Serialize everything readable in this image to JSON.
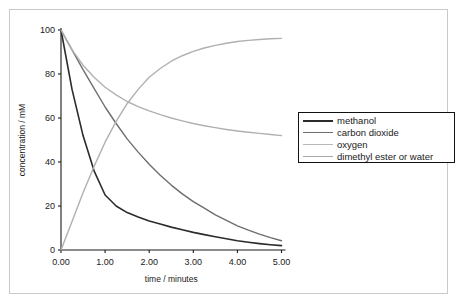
{
  "figure": {
    "background": "#ffffff",
    "frame_color": "#c9c9c9",
    "axis_color": "#1a1a1a"
  },
  "chart_data": {
    "type": "line",
    "title": "",
    "xlabel": "time / minutes",
    "ylabel": "concentration / mM",
    "xlim": [
      0,
      5
    ],
    "ylim": [
      0,
      100
    ],
    "xticks": [
      0,
      1,
      2,
      3,
      4,
      5
    ],
    "xtick_labels": [
      "0.00",
      "1.00",
      "2.00",
      "3.00",
      "4.00",
      "5.00"
    ],
    "yticks": [
      0,
      20,
      40,
      60,
      80,
      100
    ],
    "ytick_labels": [
      "0",
      "20",
      "40",
      "60",
      "80",
      "100"
    ],
    "grid": false,
    "legend_position": "right",
    "x": [
      0,
      0.25,
      0.5,
      0.75,
      1.0,
      1.25,
      1.5,
      1.75,
      2.0,
      2.25,
      2.5,
      2.75,
      3.0,
      3.25,
      3.5,
      3.75,
      4.0,
      4.25,
      4.5,
      4.75,
      5.0
    ],
    "series": [
      {
        "name": "methanol",
        "color": "#2b2b2b",
        "width": 1.6,
        "values": [
          100,
          73,
          52,
          36,
          25,
          20,
          17,
          15,
          13.2,
          11.8,
          10.4,
          9.2,
          8.0,
          7.0,
          6.0,
          5.1,
          4.2,
          3.5,
          2.9,
          2.4,
          2.0
        ]
      },
      {
        "name": "carbon dioxide",
        "color": "#6e6e6e",
        "width": 1.4,
        "values": [
          100,
          91,
          82,
          73.5,
          65,
          57.5,
          50.5,
          44.5,
          39,
          34,
          29.5,
          25.5,
          22,
          19,
          16,
          13.5,
          11,
          9,
          7.2,
          5.6,
          4.2
        ]
      },
      {
        "name": "oxygen",
        "color": "#b0b0b0",
        "width": 1.4,
        "values": [
          100,
          91,
          84,
          78.5,
          74,
          70.5,
          67.5,
          65.2,
          63.2,
          61.5,
          60,
          58.7,
          57.5,
          56.5,
          55.6,
          54.8,
          54.1,
          53.5,
          53.0,
          52.5,
          52.0
        ]
      },
      {
        "name": "dimethyl ester or water",
        "color": "#b0b0b0",
        "width": 1.4,
        "values": [
          0,
          13,
          26,
          38,
          49,
          58.5,
          66.5,
          73,
          78.5,
          82.5,
          85.8,
          88.3,
          90.3,
          91.8,
          93.0,
          94.0,
          94.8,
          95.3,
          95.7,
          96.0,
          96.2
        ]
      }
    ]
  },
  "legend": {
    "items": [
      {
        "label": "methanol",
        "color": "#2b2b2b",
        "width": 2.0
      },
      {
        "label": "carbon dioxide",
        "color": "#6e6e6e",
        "width": 1.4
      },
      {
        "label": "oxygen",
        "color": "#b8b8b8",
        "width": 1.2
      },
      {
        "label": "dimethyl ester or water",
        "color": "#a8a8a8",
        "width": 1.4
      }
    ]
  }
}
